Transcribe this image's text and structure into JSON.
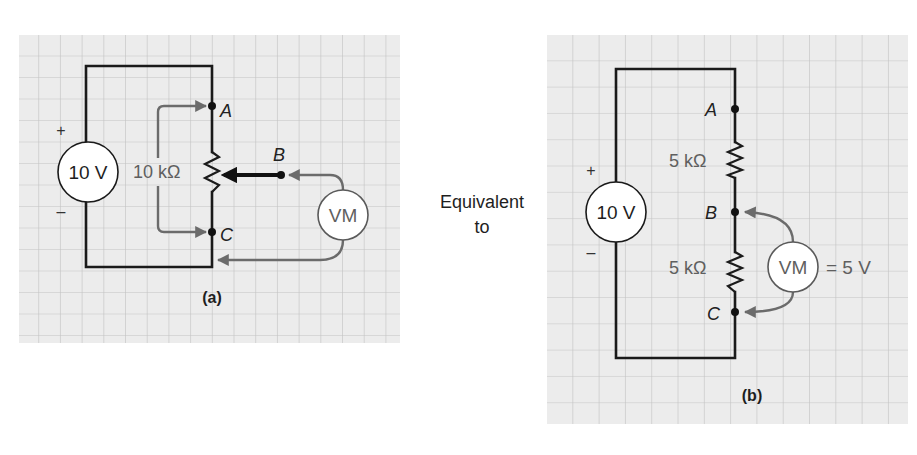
{
  "figure": {
    "connector_text": [
      "Equivalent",
      "to"
    ],
    "colors": {
      "panel_background": "#ececec",
      "grid_line": "#c2c2c2",
      "wire": "#1a1a1a",
      "probe_lead": "#6b6b6b",
      "label_gray": "#5f5f5f"
    }
  },
  "panel_a": {
    "caption": "(a)",
    "source": {
      "label": "10 V",
      "plus": "+",
      "minus": "–"
    },
    "potentiometer": {
      "label": "10 kΩ"
    },
    "nodes": {
      "A": "A",
      "B": "B",
      "C": "C"
    },
    "meter": {
      "label": "VM"
    }
  },
  "panel_b": {
    "caption": "(b)",
    "source": {
      "label": "10 V",
      "plus": "+",
      "minus": "–"
    },
    "resistors": [
      {
        "label": "5 kΩ"
      },
      {
        "label": "5 kΩ"
      }
    ],
    "nodes": {
      "A": "A",
      "B": "B",
      "C": "C"
    },
    "meter": {
      "label": "VM",
      "reading": "= 5 V"
    }
  }
}
